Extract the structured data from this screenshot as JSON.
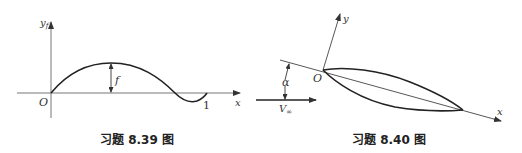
{
  "figures": [
    {
      "id": "fig-8-39",
      "caption": "习题 8.39 图",
      "labels": {
        "y_axis": "y",
        "y_axis_sub": "f",
        "x_axis": "x",
        "origin": "O",
        "end_tick": "1",
        "camber": "f"
      }
    },
    {
      "id": "fig-8-40",
      "caption": "习题 8.40 图",
      "labels": {
        "y_axis": "y",
        "x_axis": "x",
        "origin": "O",
        "angle": "α",
        "velocity": "V",
        "velocity_sub": "∞"
      }
    }
  ],
  "colors": {
    "line": "#333333",
    "axis": "#777777",
    "text": "#222222"
  }
}
